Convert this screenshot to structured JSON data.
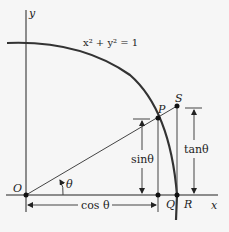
{
  "diagram": {
    "equation": "x² + y² = 1",
    "axes": {
      "x_label": "x",
      "y_label": "y"
    },
    "points": {
      "origin": "O",
      "P": "P",
      "S": "S",
      "Q": "Q",
      "R": "R"
    },
    "angle_label": "θ",
    "measures": {
      "sin": "sinθ",
      "cos": "cos θ",
      "tan": "tanθ"
    },
    "colors": {
      "background": "#f6f6f6",
      "stroke": "#222222"
    }
  }
}
